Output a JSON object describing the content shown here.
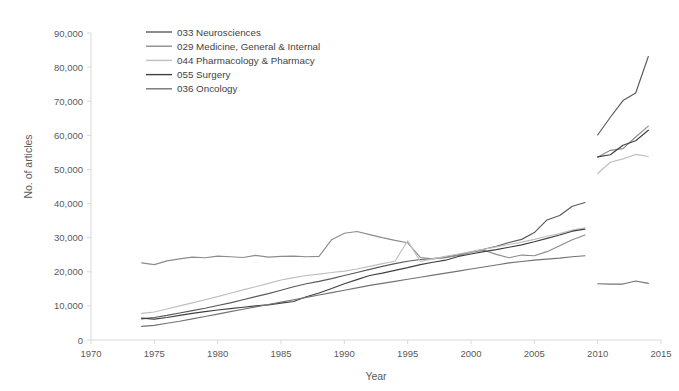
{
  "chart_data": {
    "type": "line",
    "title": "",
    "subtitle": "",
    "xlabel": "Year",
    "ylabel": "No. of articles",
    "xlim": [
      1970,
      2015
    ],
    "ylim": [
      0,
      90000
    ],
    "grid": false,
    "legend_position": "top-left",
    "x_ticks": [
      1970,
      1975,
      1980,
      1985,
      1990,
      1995,
      2000,
      2005,
      2010,
      2015
    ],
    "x_tick_labels": [
      "1970",
      "1975",
      "1980",
      "1985",
      "1990",
      "1995",
      "2000",
      "2005",
      "2010",
      "2015"
    ],
    "y_ticks": [
      0,
      10000,
      20000,
      30000,
      40000,
      50000,
      60000,
      70000,
      80000,
      90000
    ],
    "y_tick_labels": [
      "0",
      "10,000",
      "20,000",
      "30,000",
      "40,000",
      "50,000",
      "60,000",
      "70,000",
      "80,000",
      "90,000"
    ],
    "note": "Each series is drawn as two disconnected segments: 1974-2009 and 2010-2014.",
    "series": [
      {
        "name": "033 Neurosciences",
        "color": "#595959",
        "segments": [
          {
            "x": [
              1974,
              1975,
              1976,
              1977,
              1978,
              1979,
              1980,
              1981,
              1982,
              1983,
              1984,
              1985,
              1986,
              1987,
              1988,
              1989,
              1990,
              1991,
              1992,
              1993,
              1994,
              1995,
              1996,
              1997,
              1998,
              1999,
              2000,
              2001,
              2002,
              2003,
              2004,
              2005,
              2006,
              2007,
              2008,
              2009
            ],
            "y": [
              6200,
              6600,
              7200,
              7900,
              8600,
              9300,
              10100,
              10900,
              11800,
              12700,
              13600,
              14600,
              15600,
              16500,
              17200,
              18000,
              18900,
              19800,
              20700,
              21600,
              22400,
              23100,
              23600,
              23900,
              24300,
              25000,
              25800,
              26600,
              27500,
              28600,
              29500,
              31500,
              35200,
              36500,
              39200,
              40300
            ]
          },
          {
            "x": [
              2010,
              2011,
              2012,
              2013,
              2014
            ],
            "y": [
              60100,
              65300,
              70200,
              72400,
              83100
            ]
          }
        ]
      },
      {
        "name": "029 Medicine, General & Internal",
        "color": "#8c8c8c",
        "segments": [
          {
            "x": [
              1974,
              1975,
              1976,
              1977,
              1978,
              1979,
              1980,
              1981,
              1982,
              1983,
              1984,
              1985,
              1986,
              1987,
              1988,
              1989,
              1990,
              1991,
              1992,
              1993,
              1994,
              1995,
              1996,
              1997,
              1998,
              1999,
              2000,
              2001,
              2002,
              2003,
              2004,
              2005,
              2006,
              2007,
              2008,
              2009
            ],
            "y": [
              22600,
              22100,
              23200,
              23800,
              24300,
              24100,
              24600,
              24400,
              24200,
              24800,
              24300,
              24500,
              24600,
              24400,
              24500,
              29400,
              31300,
              31800,
              30900,
              30000,
              29200,
              28500,
              24200,
              23800,
              24100,
              24800,
              25700,
              26300,
              25100,
              24100,
              24900,
              24700,
              25900,
              27600,
              29400,
              30800
            ]
          },
          {
            "x": [
              2010,
              2011,
              2012,
              2013,
              2014
            ],
            "y": [
              53600,
              55600,
              56100,
              59500,
              62700
            ]
          }
        ]
      },
      {
        "name": "044 Pharmacology & Pharmacy",
        "color": "#bfbfbf",
        "segments": [
          {
            "x": [
              1974,
              1975,
              1976,
              1977,
              1978,
              1979,
              1980,
              1981,
              1982,
              1983,
              1984,
              1985,
              1986,
              1987,
              1988,
              1989,
              1990,
              1991,
              1992,
              1993,
              1994,
              1995,
              1996,
              1997,
              1998,
              1999,
              2000,
              2001,
              2002,
              2003,
              2004,
              2005,
              2006,
              2007,
              2008,
              2009
            ],
            "y": [
              7800,
              8200,
              9100,
              10000,
              10900,
              11800,
              12700,
              13700,
              14700,
              15600,
              16600,
              17600,
              18300,
              18900,
              19300,
              19800,
              20200,
              20800,
              21600,
              22400,
              23100,
              29100,
              23000,
              23800,
              24500,
              25200,
              25900,
              26600,
              27300,
              28000,
              28700,
              29500,
              30400,
              31200,
              32200,
              32900
            ]
          },
          {
            "x": [
              2010,
              2011,
              2012,
              2013,
              2014
            ],
            "y": [
              48800,
              52100,
              53100,
              54400,
              53800
            ]
          }
        ]
      },
      {
        "name": "055 Surgery",
        "color": "#404040",
        "segments": [
          {
            "x": [
              1974,
              1975,
              1976,
              1977,
              1978,
              1979,
              1980,
              1981,
              1982,
              1983,
              1984,
              1985,
              1986,
              1987,
              1988,
              1989,
              1990,
              1991,
              1992,
              1993,
              1994,
              1995,
              1996,
              1997,
              1998,
              1999,
              2000,
              2001,
              2002,
              2003,
              2004,
              2005,
              2006,
              2007,
              2008,
              2009
            ],
            "y": [
              6400,
              6100,
              6600,
              7200,
              7800,
              8300,
              8800,
              9200,
              9600,
              10000,
              10300,
              10800,
              11300,
              12700,
              13800,
              15100,
              16500,
              17700,
              18900,
              19600,
              20400,
              21200,
              22100,
              22800,
              23400,
              24500,
              25200,
              25900,
              26500,
              27200,
              27900,
              28800,
              29800,
              30800,
              31900,
              32500
            ]
          },
          {
            "x": [
              2010,
              2011,
              2012,
              2013,
              2014
            ],
            "y": [
              53700,
              54300,
              57100,
              58400,
              61500
            ]
          }
        ]
      },
      {
        "name": "036 Oncology",
        "color": "#737373",
        "segments": [
          {
            "x": [
              1974,
              1975,
              1976,
              1977,
              1978,
              1979,
              1980,
              1981,
              1982,
              1983,
              1984,
              1985,
              1986,
              1987,
              1988,
              1989,
              1990,
              1991,
              1992,
              1993,
              1994,
              1995,
              1996,
              1997,
              1998,
              1999,
              2000,
              2001,
              2002,
              2003,
              2004,
              2005,
              2006,
              2007,
              2008,
              2009
            ],
            "y": [
              4000,
              4300,
              4900,
              5500,
              6200,
              6900,
              7600,
              8300,
              9000,
              9700,
              10400,
              11100,
              11800,
              12500,
              13200,
              13900,
              14600,
              15300,
              16000,
              16600,
              17200,
              17800,
              18400,
              19000,
              19600,
              20200,
              20800,
              21400,
              22000,
              22600,
              23000,
              23400,
              23700,
              24000,
              24400,
              24700
            ]
          },
          {
            "x": [
              2010,
              2011,
              2012,
              2013,
              2014
            ],
            "y": [
              16500,
              16400,
              16400,
              17300,
              16600
            ]
          }
        ]
      }
    ]
  },
  "legend": {
    "items": [
      {
        "label": "033 Neurosciences"
      },
      {
        "label": "029 Medicine, General & Internal"
      },
      {
        "label": "044 Pharmacology & Pharmacy"
      },
      {
        "label": "055 Surgery"
      },
      {
        "label": "036 Oncology"
      }
    ]
  }
}
